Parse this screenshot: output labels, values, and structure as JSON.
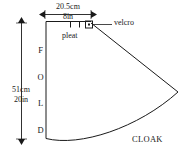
{
  "diagram": {
    "title": "CLOAK",
    "labels": {
      "fold": [
        "F",
        "O",
        "L",
        "D"
      ],
      "pleat": "pleat",
      "velcro": "velcro",
      "cloak": "CLOAK"
    },
    "dimensions": {
      "width_cm": "20.5cm",
      "width_in": "8in",
      "height_cm": "51cm",
      "height_in": "20in"
    },
    "colors": {
      "line": "#1a1a1a",
      "background": "#ffffff",
      "text": "#1a1a1a"
    }
  }
}
